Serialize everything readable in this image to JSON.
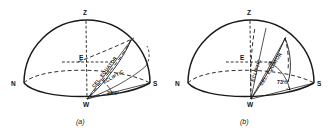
{
  "figure": {
    "panels": [
      {
        "id": "a",
        "caption": "(a)",
        "points": {
          "zenith": "Z",
          "north": "N",
          "south": "S",
          "east": "E",
          "west": "W"
        },
        "curves": {
          "equator": "CEL. EQUATOR",
          "ecliptic": "ECLIPTIC"
        },
        "angle": "24½°"
      },
      {
        "id": "b",
        "caption": "(b)",
        "points": {
          "zenith": "Z",
          "north": "N",
          "south": "S",
          "east": "E",
          "west": "W"
        },
        "curves": {
          "equator": "CEL. EQUATOR",
          "ecliptic": "ECLIPTIC"
        },
        "angle": "73½°"
      }
    ],
    "colors": {
      "ink": "#1a1a1a",
      "background": "#ffffff"
    }
  }
}
